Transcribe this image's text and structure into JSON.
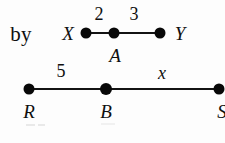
{
  "figure": {
    "type": "geometry-segment-diagram",
    "background_color": "#fdfdfd",
    "ink_color": "#0f0f0f",
    "lead_text": "by",
    "diagrams": [
      {
        "id": "segment-xy",
        "points": [
          {
            "label": "X",
            "x": 86,
            "y": 33
          },
          {
            "label": "A",
            "x": 114,
            "y": 33
          },
          {
            "label": "Y",
            "x": 160,
            "y": 33
          }
        ],
        "endpoint_labels": [
          {
            "text": "X",
            "x": 68,
            "y": 33,
            "style": "italic"
          },
          {
            "text": "Y",
            "x": 180,
            "y": 33,
            "style": "italic"
          }
        ],
        "interior_labels": [
          {
            "text": "A",
            "x": 115,
            "y": 55,
            "style": "italic"
          }
        ],
        "measures": [
          {
            "text": "2",
            "x": 99,
            "y": 14,
            "between": "X-A"
          },
          {
            "text": "3",
            "x": 134,
            "y": 14,
            "between": "A-Y"
          }
        ]
      },
      {
        "id": "segment-rs",
        "points": [
          {
            "label": "R",
            "x": 29,
            "y": 89
          },
          {
            "label": "B",
            "x": 106,
            "y": 89
          },
          {
            "label": "S",
            "x": 219,
            "y": 89
          }
        ],
        "endpoint_labels": [
          {
            "text": "R",
            "x": 29,
            "y": 111,
            "style": "italic"
          },
          {
            "text": "S",
            "x": 222,
            "y": 111,
            "style": "italic"
          }
        ],
        "interior_labels": [
          {
            "text": "B",
            "x": 106,
            "y": 111,
            "style": "italic"
          }
        ],
        "measures": [
          {
            "text": "5",
            "x": 61,
            "y": 71,
            "between": "R-B"
          },
          {
            "text": "x",
            "x": 162,
            "y": 73,
            "between": "B-S"
          }
        ]
      }
    ]
  }
}
